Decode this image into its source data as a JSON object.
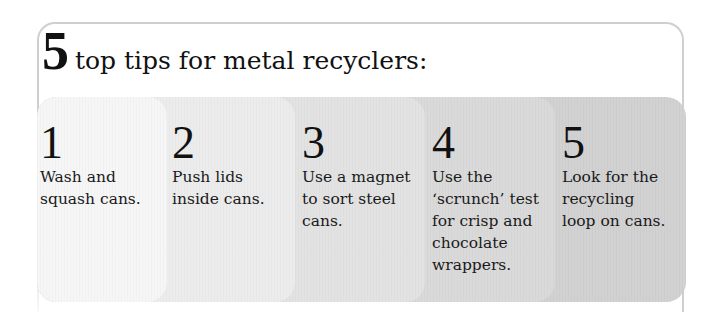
{
  "header": {
    "number": "5",
    "title": "top tips for metal recyclers:"
  },
  "tips": [
    {
      "number": "1",
      "text": "Wash and\nsquash cans."
    },
    {
      "number": "2",
      "text": "Push lids\ninside cans."
    },
    {
      "number": "3",
      "text": "Use a magnet\nto sort steel\ncans."
    },
    {
      "number": "4",
      "text": "Use the\n‘scrunch’ test\nfor crisp and\nchocolate\nwrappers."
    },
    {
      "number": "5",
      "text": "Look for the\nrecycling\nloop on cans."
    }
  ],
  "colors": {
    "frame_border": "#cfcfcf",
    "panel_1": "#f6f6f6",
    "panel_2": "#ececec",
    "panel_3": "#e2e2e2",
    "panel_4": "#d9d9d9",
    "panel_5": "#d1d1d1"
  }
}
